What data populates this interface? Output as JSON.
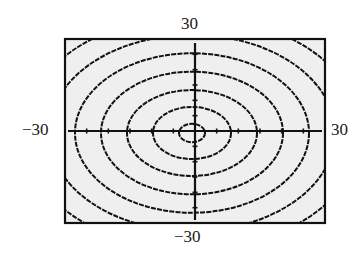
{
  "chart_data": {
    "type": "contour",
    "title": "",
    "xlabel": "",
    "ylabel": "",
    "xlim": [
      -30,
      30
    ],
    "ylim": [
      -30,
      30
    ],
    "grid": false,
    "axes_tick_spacing": 5,
    "window_labels": {
      "ymax": "30",
      "ymin": "−30",
      "xmin": "−30",
      "xmax": "30"
    },
    "center": [
      0,
      0
    ],
    "contours": [
      {
        "level": 1,
        "semi_axis_x": 3,
        "semi_axis_y": 3
      },
      {
        "level": 2,
        "semi_axis_x": 9,
        "semi_axis_y": 8.5
      },
      {
        "level": 3,
        "semi_axis_x": 15,
        "semi_axis_y": 14
      },
      {
        "level": 4,
        "semi_axis_x": 21,
        "semi_axis_y": 20
      },
      {
        "level": 5,
        "semi_axis_x": 27,
        "semi_axis_y": 26
      },
      {
        "level": 6,
        "semi_axis_x": 33,
        "semi_axis_y": 32
      },
      {
        "level": 7,
        "semi_axis_x": 39,
        "semi_axis_y": 38
      }
    ]
  },
  "colors": {
    "plot_background": "#efefef",
    "frame": "#111111",
    "curve": "#111111",
    "page_background": "#ffffff"
  }
}
